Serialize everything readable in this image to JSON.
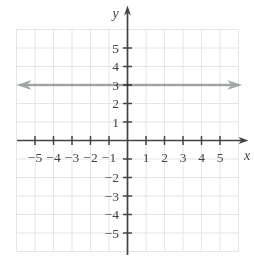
{
  "page": {
    "background": "#ffffff"
  },
  "chart_data": {
    "type": "line",
    "title": "",
    "xlabel": "x",
    "ylabel": "y",
    "xlim": [
      -6.3,
      6.8
    ],
    "ylim": [
      -6.9,
      7.4
    ],
    "x_ticks": [
      -5,
      -4,
      -3,
      -2,
      -1,
      1,
      2,
      3,
      4,
      5
    ],
    "x_tick_labels": [
      "−5",
      "−4",
      "−3",
      "−2",
      "−1",
      "1",
      "2",
      "3",
      "4",
      "5"
    ],
    "y_ticks": [
      -5,
      -4,
      -3,
      -2,
      -1,
      1,
      2,
      3,
      4,
      5
    ],
    "y_tick_labels": [
      "−5",
      "−4",
      "−3",
      "−2",
      "",
      "1",
      "2",
      "3",
      "4",
      "5"
    ],
    "grid": true,
    "grid_range": [
      -6,
      6
    ],
    "legend": false,
    "series": [
      {
        "name": "horizontal line y = 3",
        "points": [
          [
            -6,
            3
          ],
          [
            6.2,
            3
          ]
        ],
        "arrows": "both"
      }
    ],
    "colors": {
      "axis": "#45433f",
      "tick_label": "#45433f",
      "grid": "#e4e6e2",
      "line": "#a8ada9",
      "background": "#ffffff"
    }
  }
}
